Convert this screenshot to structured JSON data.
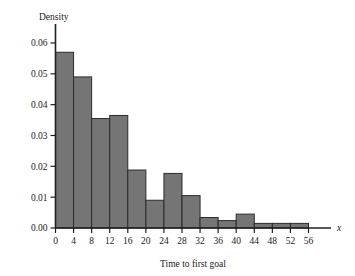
{
  "chart_data": {
    "type": "bar",
    "title": "",
    "subtitle": "",
    "xlabel": "Time to first goal",
    "ylabel": "Density",
    "x_axis_variable": "x",
    "bin_width": 4,
    "bin_edges": [
      0,
      4,
      8,
      12,
      16,
      20,
      24,
      28,
      32,
      36,
      40,
      44,
      48,
      52,
      56
    ],
    "categories": [
      "0-4",
      "4-8",
      "8-12",
      "12-16",
      "16-20",
      "20-24",
      "24-28",
      "28-32",
      "32-36",
      "36-40",
      "40-44",
      "44-48",
      "48-52",
      "52-56"
    ],
    "values": [
      0.057,
      0.049,
      0.0355,
      0.0365,
      0.0188,
      0.009,
      0.0177,
      0.0105,
      0.0034,
      0.0024,
      0.0045,
      0.0015,
      0.0015,
      0.0015
    ],
    "xlim": [
      0,
      56
    ],
    "ylim": [
      0,
      0.06
    ],
    "xticks": [
      0,
      4,
      8,
      12,
      16,
      20,
      24,
      28,
      32,
      36,
      40,
      44,
      48,
      52,
      56
    ],
    "xtick_labels": [
      "0",
      "4",
      "8",
      "12",
      "16",
      "20",
      "24",
      "28",
      "32",
      "36",
      "40",
      "44",
      "48",
      "52",
      "56"
    ],
    "yticks": [
      0.0,
      0.01,
      0.02,
      0.03,
      0.04,
      0.05,
      0.06
    ],
    "ytick_labels": [
      "0.00",
      "0.01",
      "0.02",
      "0.03",
      "0.04",
      "0.05",
      "0.06"
    ],
    "grid": false,
    "legend": false,
    "legend_position": "none",
    "bar_fill_color": "#757575",
    "bar_edge_color": "#2b2b2b",
    "axis_color": "#1f1f1f",
    "background_color": "#ffffff"
  }
}
